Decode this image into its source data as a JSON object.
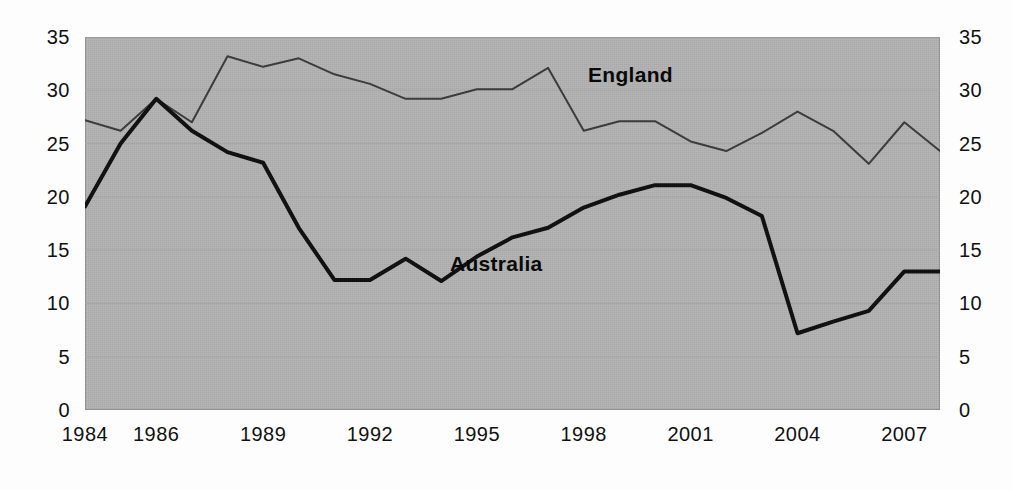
{
  "chart_data": {
    "type": "line",
    "title": "",
    "xlabel": "",
    "ylabel": "",
    "ylim": [
      0,
      35
    ],
    "ytick_step": 5,
    "yticks": [
      0,
      5,
      10,
      15,
      20,
      25,
      30,
      35
    ],
    "xlim": [
      1984,
      2008
    ],
    "xticks": [
      1984,
      1986,
      1989,
      1992,
      1995,
      1998,
      2001,
      2004,
      2007
    ],
    "xtick_labels": [
      "1984",
      "1986",
      "1989",
      "1992",
      "1995",
      "1998",
      "2001",
      "2004",
      "2007"
    ],
    "ytick_labels_left": [
      "35",
      "30",
      "25",
      "20",
      "15",
      "10",
      "5",
      "0"
    ],
    "ytick_labels_right": [
      "35",
      "30",
      "25",
      "20",
      "15",
      "10",
      "5",
      "0"
    ],
    "grid": true,
    "grid_axis": "y",
    "legend_position": "inline-annotation",
    "x": [
      1984,
      1985,
      1986,
      1987,
      1988,
      1989,
      1990,
      1991,
      1992,
      1993,
      1994,
      1995,
      1996,
      1997,
      1998,
      1999,
      2000,
      2001,
      2002,
      2003,
      2004,
      2005,
      2006,
      2007,
      2008
    ],
    "series": [
      {
        "name": "England",
        "color": "#3c3c3c",
        "line_width": 2,
        "label_text": "England",
        "values": [
          27.2,
          26.2,
          29.2,
          27.0,
          33.2,
          32.2,
          33.0,
          31.5,
          30.6,
          29.2,
          29.2,
          30.1,
          30.1,
          32.1,
          26.2,
          27.1,
          27.1,
          25.2,
          24.3,
          26.0,
          28.0,
          26.2,
          23.1,
          27.0,
          24.3
        ]
      },
      {
        "name": "Australia",
        "color": "#111111",
        "line_width": 4,
        "label_text": "Australia",
        "values": [
          19.1,
          25.0,
          29.2,
          26.2,
          24.2,
          23.2,
          17.1,
          12.2,
          12.2,
          14.2,
          12.1,
          14.4,
          16.2,
          17.1,
          19.0,
          20.2,
          21.1,
          21.1,
          19.9,
          18.2,
          7.2,
          8.3,
          9.3,
          13.0,
          13.0
        ]
      }
    ],
    "annotations": [
      {
        "text": "England",
        "x_px": 588,
        "y_px": 63,
        "series": "England"
      },
      {
        "text": "Australia",
        "x_px": 450,
        "y_px": 252,
        "series": "Australia"
      }
    ],
    "colors": {
      "plot_background": "#b2b2b2",
      "page_background": "#ffffff",
      "gridline": "#a6a6a6",
      "axis_text": "#111111",
      "england_line": "#3c3c3c",
      "australia_line": "#111111"
    }
  }
}
